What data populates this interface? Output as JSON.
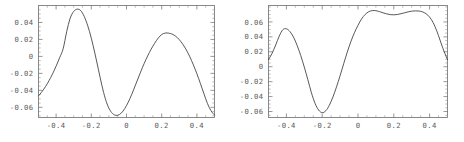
{
  "figure": {
    "background_color": "#ffffff",
    "curve_color": "#3a3a3a",
    "frame_color": "#6b6b6b",
    "label_color": "#5a5a5a"
  },
  "chart_data": [
    {
      "id": "left",
      "type": "line",
      "title": "",
      "xlabel": "",
      "ylabel": "",
      "xlim": [
        -0.5,
        0.5
      ],
      "ylim": [
        -0.072,
        0.06
      ],
      "grid": false,
      "legend": null,
      "xticks": [
        -0.4,
        -0.2,
        0,
        0.2,
        0.4
      ],
      "xticklabels": [
        "-0.4",
        "-0.2",
        "0",
        "0.2",
        "0.4"
      ],
      "yticks": [
        0.04,
        0.02,
        0,
        -0.02,
        -0.04,
        -0.06
      ],
      "yticklabels": [
        "0.04",
        "0.02",
        "0",
        "-0.02",
        "-0.04",
        "-0.06"
      ],
      "series": [
        {
          "name": "curve",
          "x": [
            -0.5,
            -0.48,
            -0.46,
            -0.44,
            -0.42,
            -0.4,
            -0.38,
            -0.36,
            -0.34,
            -0.32,
            -0.3,
            -0.28,
            -0.26,
            -0.24,
            -0.22,
            -0.2,
            -0.18,
            -0.16,
            -0.14,
            -0.12,
            -0.1,
            -0.08,
            -0.06,
            -0.04,
            -0.02,
            0.0,
            0.02,
            0.04,
            0.06,
            0.08,
            0.1,
            0.12,
            0.14,
            0.16,
            0.18,
            0.2,
            0.22,
            0.24,
            0.26,
            0.28,
            0.3,
            0.32,
            0.34,
            0.36,
            0.38,
            0.4,
            0.42,
            0.44,
            0.46,
            0.48,
            0.5
          ],
          "y": [
            -0.0465,
            -0.0415,
            -0.0355,
            -0.0285,
            -0.0205,
            -0.0115,
            -0.0015,
            0.009,
            0.029,
            0.045,
            0.053,
            0.0557,
            0.054,
            0.047,
            0.036,
            0.0215,
            0.004,
            -0.015,
            -0.034,
            -0.05,
            -0.061,
            -0.0672,
            -0.0695,
            -0.0685,
            -0.0645,
            -0.058,
            -0.0495,
            -0.0395,
            -0.029,
            -0.0185,
            -0.0085,
            0.0005,
            0.0085,
            0.0155,
            0.0215,
            0.0258,
            0.0275,
            0.0274,
            0.0262,
            0.0237,
            0.0197,
            0.0143,
            0.0076,
            -0.0005,
            -0.01,
            -0.0205,
            -0.032,
            -0.044,
            -0.0555,
            -0.064,
            -0.069
          ]
        }
      ]
    },
    {
      "id": "right",
      "type": "line",
      "title": "",
      "xlabel": "",
      "ylabel": "",
      "xlim": [
        -0.5,
        0.5
      ],
      "ylim": [
        -0.068,
        0.082
      ],
      "grid": false,
      "legend": null,
      "xticks": [
        -0.4,
        -0.2,
        0,
        0.2,
        0.4
      ],
      "xticklabels": [
        "-0.4",
        "-0.2",
        "0",
        "0.2",
        "0.4"
      ],
      "yticks": [
        0.06,
        0.04,
        0.02,
        0,
        -0.02,
        -0.04,
        -0.06
      ],
      "yticklabels": [
        "0.06",
        "0.04",
        "0.02",
        "0",
        "-0.02",
        "-0.04",
        "-0.06"
      ],
      "series": [
        {
          "name": "curve",
          "x": [
            -0.5,
            -0.48,
            -0.46,
            -0.44,
            -0.42,
            -0.4,
            -0.38,
            -0.36,
            -0.34,
            -0.32,
            -0.3,
            -0.28,
            -0.26,
            -0.24,
            -0.22,
            -0.2,
            -0.18,
            -0.16,
            -0.14,
            -0.12,
            -0.1,
            -0.08,
            -0.06,
            -0.04,
            -0.02,
            0.0,
            0.02,
            0.04,
            0.06,
            0.08,
            0.1,
            0.12,
            0.14,
            0.16,
            0.18,
            0.2,
            0.22,
            0.24,
            0.26,
            0.28,
            0.3,
            0.32,
            0.34,
            0.36,
            0.38,
            0.4,
            0.42,
            0.44,
            0.46,
            0.48,
            0.5
          ],
          "y": [
            0.0095,
            0.018,
            0.029,
            0.041,
            0.0495,
            0.0508,
            0.047,
            0.0395,
            0.0285,
            0.015,
            -0.0005,
            -0.0175,
            -0.035,
            -0.049,
            -0.058,
            -0.0615,
            -0.059,
            -0.0515,
            -0.0405,
            -0.027,
            -0.012,
            0.004,
            0.0195,
            0.0335,
            0.0455,
            0.0555,
            0.064,
            0.07,
            0.0737,
            0.0752,
            0.075,
            0.0738,
            0.0722,
            0.0708,
            0.0698,
            0.0695,
            0.07,
            0.071,
            0.0722,
            0.0735,
            0.0744,
            0.0748,
            0.0746,
            0.0735,
            0.071,
            0.0665,
            0.059,
            0.048,
            0.0345,
            0.021,
            0.0095
          ]
        }
      ]
    }
  ]
}
